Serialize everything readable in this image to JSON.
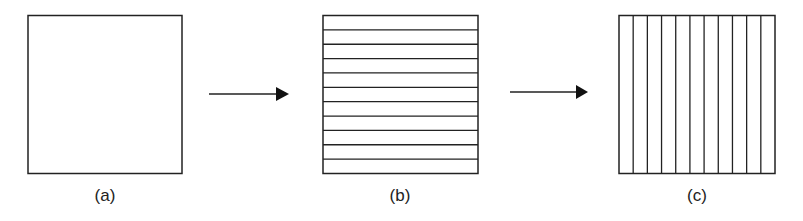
{
  "diagram": {
    "panels": [
      {
        "id": "a",
        "label": "(a)",
        "divisions": "none",
        "lines": 0
      },
      {
        "id": "b",
        "label": "(b)",
        "divisions": "horizontal",
        "lines": 10
      },
      {
        "id": "c",
        "label": "(c)",
        "divisions": "vertical",
        "lines": 10
      }
    ],
    "arrows": [
      {
        "from": "a",
        "to": "b"
      },
      {
        "from": "b",
        "to": "c"
      }
    ],
    "colors": {
      "stroke": "#222222",
      "background": "#ffffff"
    }
  }
}
